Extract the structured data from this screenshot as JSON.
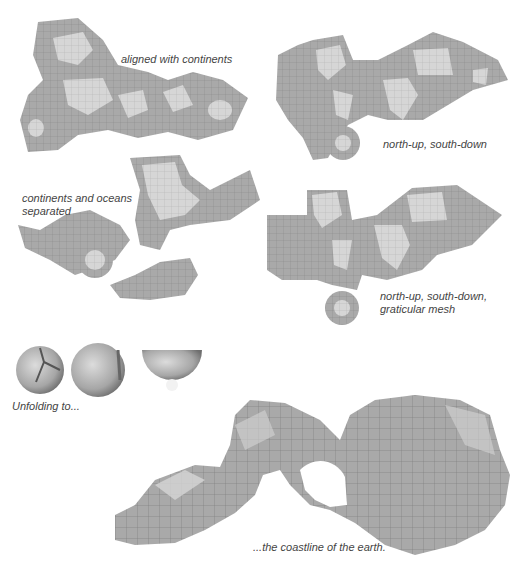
{
  "figure": {
    "colors": {
      "background": "#ffffff",
      "ocean_grey": "#a9a9a9",
      "land_grey": "#d6d6d6",
      "mesh_line": "#7e7e7e",
      "caption_text": "#444444"
    },
    "panels": [
      {
        "id": "aligned-with-continents",
        "caption_lines": [
          "aligned with continents"
        ]
      },
      {
        "id": "north-up-south-down",
        "caption_lines": [
          "north-up, south-down"
        ]
      },
      {
        "id": "continents-and-oceans-separated",
        "caption_lines": [
          "continents and oceans",
          "separated"
        ]
      },
      {
        "id": "north-up-south-down-graticular-mesh",
        "caption_lines": [
          "north-up, south-down,",
          "graticular mesh"
        ]
      },
      {
        "id": "unfolding-globes",
        "caption_lines": [
          "Unfolding to..."
        ],
        "globe_count": 3
      },
      {
        "id": "coastline-of-the-earth",
        "caption_lines": [
          "...the coastline of the earth."
        ]
      }
    ]
  }
}
